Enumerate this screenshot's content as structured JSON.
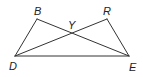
{
  "diagram": {
    "type": "geometry",
    "points": {
      "B": {
        "label": "B",
        "x": 37,
        "y": 19
      },
      "R": {
        "label": "R",
        "x": 107,
        "y": 19
      },
      "Y": {
        "label": "Y",
        "x": 71,
        "y": 33
      },
      "D": {
        "label": "D",
        "x": 15,
        "y": 56
      },
      "E": {
        "label": "E",
        "x": 129,
        "y": 56
      }
    },
    "segments": [
      {
        "from": "B",
        "to": "D"
      },
      {
        "from": "B",
        "to": "E"
      },
      {
        "from": "R",
        "to": "D"
      },
      {
        "from": "R",
        "to": "E"
      },
      {
        "from": "D",
        "to": "E"
      }
    ],
    "labels": {
      "B": "B",
      "R": "R",
      "Y": "Y",
      "D": "D",
      "E": "E"
    }
  }
}
